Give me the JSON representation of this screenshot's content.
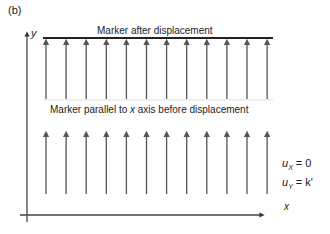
{
  "panel_label": "(b)",
  "axes": {
    "x_label": "x",
    "y_label": "y"
  },
  "top_caption": "Marker after displacement",
  "middle_caption_pre": "Marker parallel to ",
  "middle_caption_var": "x",
  "middle_caption_post": " axis before displacement",
  "equations": [
    {
      "var": "u",
      "sub": "X",
      "rhs": " = 0"
    },
    {
      "var": "u",
      "sub": "Y",
      "rhs": " = k'"
    }
  ],
  "arrow_count": 12,
  "colors": {
    "arrow": "#555555",
    "marker_line": "#222222",
    "axis": "#444444"
  }
}
